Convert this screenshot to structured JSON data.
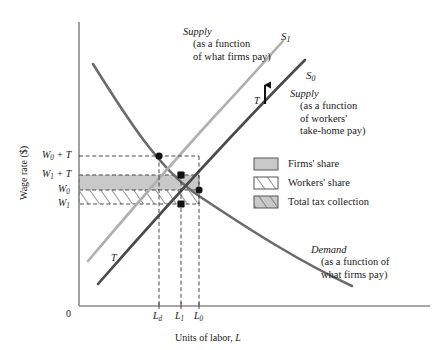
{
  "figure": {
    "type": "supply-demand-tax-incidence-diagram",
    "axes": {
      "x_title_plain": "Units of labor, ",
      "x_title_italic": "L",
      "y_title": "Wage rate ($)",
      "origin_label": "0"
    },
    "y_ticks": [
      {
        "id": "w0_plus_t",
        "base": "W",
        "sub": "0",
        "suffix": " + T",
        "y": 156
      },
      {
        "id": "w1_plus_t",
        "base": "W",
        "sub": "1",
        "suffix": " + T",
        "y": 175
      },
      {
        "id": "w0",
        "base": "W",
        "sub": "0",
        "suffix": "",
        "y": 190
      },
      {
        "id": "w1",
        "base": "W",
        "sub": "1",
        "suffix": "",
        "y": 204
      }
    ],
    "x_ticks": [
      {
        "id": "ld",
        "base": "L",
        "sub": "d",
        "x": 159
      },
      {
        "id": "l1",
        "base": "L",
        "sub": "1",
        "x": 181
      },
      {
        "id": "l0",
        "base": "L",
        "sub": "0",
        "x": 199
      }
    ],
    "curves": [
      {
        "id": "s1",
        "name_base": "S",
        "name_sub": "1",
        "color": "#b0b0b0",
        "annotation_head": "Supply",
        "annotation_lines": [
          "(as a function",
          "of what firms pay)"
        ]
      },
      {
        "id": "s0",
        "name_base": "S",
        "name_sub": "0",
        "color": "#4a4a4a",
        "annotation_head": "Supply",
        "annotation_lines": [
          "(as a function",
          "of workers'",
          "take-home pay)"
        ]
      },
      {
        "id": "demand",
        "name_base": "",
        "name_sub": "",
        "color": "#6b6b6b",
        "annotation_head": "Demand",
        "annotation_lines": [
          "(as a function of",
          "what firms pay)"
        ]
      }
    ],
    "shift_markers": [
      {
        "id": "t-upper",
        "label": "T",
        "has_arrow": true
      },
      {
        "id": "t-lower",
        "label": "T",
        "has_arrow": false
      }
    ],
    "legend": [
      {
        "id": "firms-share",
        "label": "Firms' share",
        "swatch": "solid-gray"
      },
      {
        "id": "workers-share",
        "label": "Workers' share",
        "swatch": "hatched"
      },
      {
        "id": "total-tax",
        "label": "Total tax collection",
        "swatch": "gray-hatched"
      }
    ],
    "colors": {
      "fill_gray": "#c9c9c9",
      "hatch_line": "#6a6a6a",
      "axis": "#8a8a8a",
      "dash": "#333333",
      "point": "#111111"
    }
  }
}
